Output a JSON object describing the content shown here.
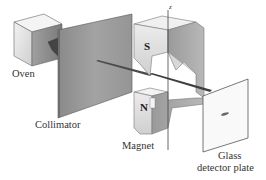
{
  "diagram": {
    "labels": {
      "oven": "Oven",
      "collimator": "Collimator",
      "magnet": "Magnet",
      "plate_line1": "Glass",
      "plate_line2": "detector plate",
      "magnet_south": "S",
      "magnet_north": "N",
      "axis_z": "z"
    },
    "colors": {
      "background": "#ffffff",
      "oven_light": "#ededed",
      "oven_dark": "#8f8f8f",
      "collimator": "#8a8a8a",
      "magnet_light": "#e6e6e6",
      "magnet_mid": "#b5b5b5",
      "magnet_dark": "#8c8c8c",
      "beam": "#444444",
      "plate": "#f7f7f7",
      "text": "#333333"
    }
  }
}
